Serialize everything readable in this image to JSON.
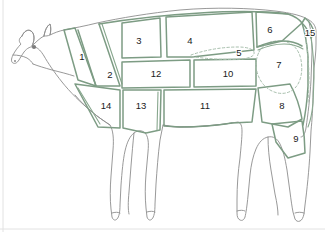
{
  "diagram": {
    "orientation": "left-facing side profile",
    "background_color": "#ffffff",
    "outline_color": "#8d8d8d",
    "cut_line_color": "#7d9c84",
    "dashed_line_color": "#a9c0ae",
    "label_color": "#1a1a1a"
  },
  "cuts": [
    {
      "number": "1",
      "x": 82,
      "y": 57,
      "region": "neck-upper"
    },
    {
      "number": "2",
      "x": 110,
      "y": 75,
      "region": "neck-lower"
    },
    {
      "number": "3",
      "x": 139,
      "y": 41,
      "region": "chuck-top"
    },
    {
      "number": "4",
      "x": 190,
      "y": 41,
      "region": "rib-top"
    },
    {
      "number": "5",
      "x": 239,
      "y": 53,
      "region": "loin-dashed"
    },
    {
      "number": "6",
      "x": 270,
      "y": 30,
      "region": "rump-top"
    },
    {
      "number": "7",
      "x": 279,
      "y": 65,
      "region": "round-dashed"
    },
    {
      "number": "8",
      "x": 282,
      "y": 106,
      "region": "hind-upper"
    },
    {
      "number": "9",
      "x": 296,
      "y": 139,
      "region": "hind-lower"
    },
    {
      "number": "10",
      "x": 228,
      "y": 74,
      "region": "flank-mid-right"
    },
    {
      "number": "11",
      "x": 205,
      "y": 106,
      "region": "belly"
    },
    {
      "number": "12",
      "x": 156,
      "y": 74,
      "region": "flank-mid-left"
    },
    {
      "number": "13",
      "x": 141,
      "y": 106,
      "region": "brisket-rear"
    },
    {
      "number": "14",
      "x": 106,
      "y": 106,
      "region": "brisket-front"
    },
    {
      "number": "15",
      "x": 310,
      "y": 33,
      "region": "tail"
    }
  ]
}
